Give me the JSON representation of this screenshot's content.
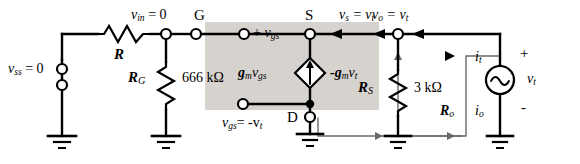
{
  "figure": {
    "kind": "small-signal-circuit-diagram",
    "colors": {
      "ink": "#000000",
      "shade": "#cfcbc6",
      "faint": "#6d6a66"
    }
  },
  "labels": {
    "vss": "v",
    "vss_sub": "ss",
    "vss_eq": " = 0",
    "R": "R",
    "vin": "v",
    "vin_sub": "in",
    "vin_eq": " = 0",
    "G": "G",
    "RG": "R",
    "RG_sub": "G",
    "RG_value": "666 kΩ",
    "plus_vgs_plus": "+ ",
    "vgs": "v",
    "vgs_sub": "gs",
    "minus_sign": " -",
    "S": "S",
    "vs_eq": "v",
    "vs_sub": "s",
    "vs_rhs": " = v",
    "vs_rhs_sub": "t",
    "gmvgs": "g",
    "gmvgs_m": "m",
    "gmvgs_v": "v",
    "gmvgs_gs": "gs",
    "neg_gmvt": "-g",
    "neg_gmvt_m": "m",
    "neg_gmvt_v": "v",
    "neg_gmvt_t": "t",
    "D": "D",
    "vgs_eq_lhs": "v",
    "vgs_eq_sub": "gs",
    "vgs_eq_rhs": "= -v",
    "vgs_eq_rhs_sub": "t",
    "vo_eq": "v",
    "vo_sub": "o",
    "vo_rhs": " = v",
    "vo_rhs_sub": "t",
    "RS": "R",
    "RS_sub": "S",
    "RS_value": "3 kΩ",
    "it": "i",
    "it_sub": "t",
    "io": "i",
    "io_sub": "o",
    "Ro": "R",
    "Ro_sub": "o",
    "vt": "v",
    "vt_sub": "t",
    "polarity_plus": "+",
    "polarity_minus": "-"
  },
  "components": [
    {
      "name": "resistor-R",
      "label": "R"
    },
    {
      "name": "resistor-RG",
      "label": "R_G",
      "value": "666 kΩ"
    },
    {
      "name": "resistor-RS",
      "label": "R_S",
      "value": "3 kΩ"
    },
    {
      "name": "dependent-current-source",
      "label": "g_m v_gs",
      "alt_label": "-g_m v_t"
    },
    {
      "name": "ac-voltage-source",
      "label": "v_t"
    }
  ],
  "nodes": [
    {
      "name": "node-vss",
      "label": "v_ss = 0"
    },
    {
      "name": "node-gate",
      "label": "G",
      "voltage": "v_in = 0"
    },
    {
      "name": "node-source",
      "label": "S",
      "voltage": "v_s = v_t"
    },
    {
      "name": "node-drain",
      "label": "D"
    },
    {
      "name": "node-output",
      "label": "v_o = v_t"
    }
  ],
  "annotations": [
    {
      "name": "annotation-vgs-polarity",
      "text": "+ v_gs -"
    },
    {
      "name": "annotation-vgs-value",
      "text": "v_gs = -v_t"
    },
    {
      "name": "annotation-current-it",
      "text": "i_t"
    },
    {
      "name": "annotation-current-io",
      "text": "i_o"
    },
    {
      "name": "annotation-resistance-ro",
      "text": "R_o"
    }
  ]
}
